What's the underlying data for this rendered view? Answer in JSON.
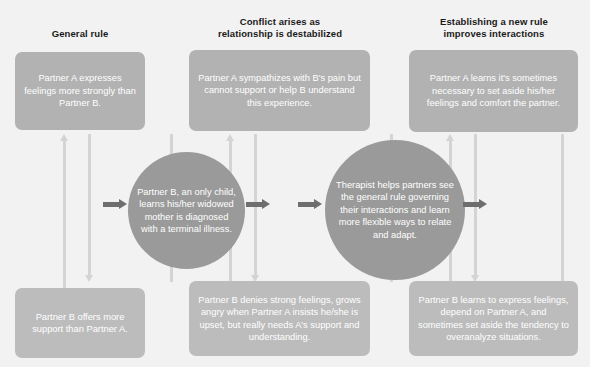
{
  "diagram": {
    "background_color": "#f2f2f2",
    "box_color": "#b2b2b2",
    "circle_color": "#9a9a9a",
    "arrow_color_vertical": "#d4d4d4",
    "arrow_color_horizontal": "#6e6e6e",
    "text_color": "#ffffff",
    "heading_color": "#1a1a1a"
  },
  "columns": [
    {
      "heading": "General rule"
    },
    {
      "heading_line1": "Conflict arises as",
      "heading_line2": "relationship is destabilized"
    },
    {
      "heading_line1": "Establishing a new rule",
      "heading_line2": "improves interactions"
    }
  ],
  "top_boxes": [
    {
      "text": "Partner A expresses feelings more strongly than Partner B."
    },
    {
      "text": "Partner A sympathizes with B's pain but cannot support or help B understand this experience."
    },
    {
      "text": "Partner A learns it's sometimes necessary to set aside his/her feelings and comfort the partner."
    }
  ],
  "circles": [
    {
      "text": "Partner B, an only child, learns his/her widowed mother is diagnosed with a terminal illness."
    },
    {
      "text": "Therapist helps partners see the general rule governing their interactions and learn more flexible ways to relate and adapt."
    }
  ],
  "bottom_boxes": [
    {
      "text": "Partner B offers more support than Partner A."
    },
    {
      "text": "Partner B denies strong feelings, grows angry when Partner A insists he/she is upset, but really needs A's support and understanding."
    },
    {
      "text": "Partner B learns to express feelings, depend on Partner A, and sometimes set aside the tendency to overanalyze situations."
    }
  ],
  "arrows": {
    "up_label": "upward flow arrow",
    "down_label": "downward flow arrow",
    "right_label": "rightward progression arrow"
  }
}
